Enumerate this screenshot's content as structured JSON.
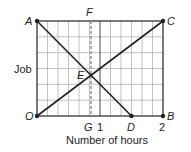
{
  "diagram": {
    "ylabel": "Job",
    "xlabel": "Number of hours",
    "x_ticks": [
      {
        "label": "1",
        "value": 1
      },
      {
        "label": "2",
        "value": 2
      }
    ],
    "points": {
      "A": {
        "label": "A",
        "x": 0,
        "y": 1
      },
      "C": {
        "label": "C",
        "x": 2,
        "y": 1
      },
      "O": {
        "label": "O",
        "x": 0,
        "y": 0
      },
      "B": {
        "label": "B",
        "x": 2,
        "y": 0
      },
      "D": {
        "label": "D",
        "x": 1.5,
        "y": 0
      },
      "E": {
        "label": "E",
        "x": 0.857,
        "y": 0.429
      },
      "F": {
        "label": "F",
        "x": 0.857,
        "y": 1
      },
      "G": {
        "label": "G",
        "x": 0.857,
        "y": 0
      }
    },
    "segments": [
      {
        "from": "A",
        "to": "D",
        "style": "solid"
      },
      {
        "from": "O",
        "to": "C",
        "style": "solid"
      },
      {
        "from": "F",
        "to": "G",
        "style": "dashed"
      }
    ],
    "grid": {
      "columns": 12,
      "rows": 6
    },
    "colors": {
      "line": "#222222",
      "grid": "#9a9a9a",
      "dashed": "#9a9a9a"
    }
  }
}
